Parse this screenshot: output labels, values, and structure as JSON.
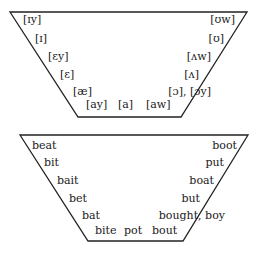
{
  "phonetic_chart": {
    "front": [
      "[ɪy]",
      "[ɪ]",
      "[ɛy]",
      "[ɛ]",
      "[æ]"
    ],
    "back": [
      "[ʊw]",
      "[ʊ]",
      "[ʌw]",
      "[ʌ]",
      "[ɔ], [ɔy]"
    ],
    "bottom": [
      "[ay]",
      "[a]",
      "[aw]"
    ]
  },
  "word_chart": {
    "front": [
      "beat",
      "bit",
      "bait",
      "bet",
      "bat"
    ],
    "back": [
      "boot",
      "put",
      "boat",
      "but",
      "bought, boy"
    ],
    "bottom": [
      "bite",
      "pot",
      "bout"
    ]
  },
  "colors": {
    "line": "#222222",
    "text": "#1a1a1a"
  }
}
